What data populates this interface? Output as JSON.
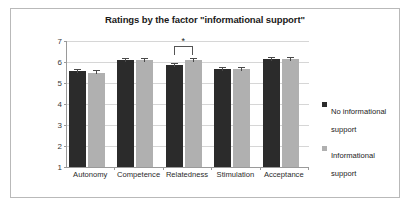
{
  "chart_data": {
    "type": "bar",
    "title": "Ratings by the factor \"informational support\"",
    "xlabel": "",
    "ylabel": "",
    "ylim": [
      1,
      7
    ],
    "yticks": [
      1,
      2,
      3,
      4,
      5,
      6,
      7
    ],
    "grid": true,
    "legend_position": "right",
    "categories": [
      "Autonomy",
      "Competence",
      "Relatedness",
      "Stimulation",
      "Acceptance"
    ],
    "series": [
      {
        "name": "No informational support",
        "color": "#2b2b2b",
        "values": [
          5.55,
          6.1,
          5.85,
          5.65,
          6.15
        ],
        "errors": [
          0.13,
          0.09,
          0.08,
          0.1,
          0.09
        ]
      },
      {
        "name": "Informational support",
        "color": "#b0b0b0",
        "values": [
          5.5,
          6.1,
          6.1,
          5.65,
          6.15
        ],
        "errors": [
          0.14,
          0.1,
          0.1,
          0.1,
          0.1
        ]
      }
    ],
    "annotations": [
      {
        "type": "significance-bracket",
        "label": "*",
        "category": "Relatedness",
        "between": [
          "No informational support",
          "Informational support"
        ]
      }
    ]
  },
  "legend": {
    "entries": [
      {
        "label": "No informational support",
        "color": "#2b2b2b"
      },
      {
        "label": "Informational support",
        "color": "#b0b0b0"
      }
    ]
  }
}
